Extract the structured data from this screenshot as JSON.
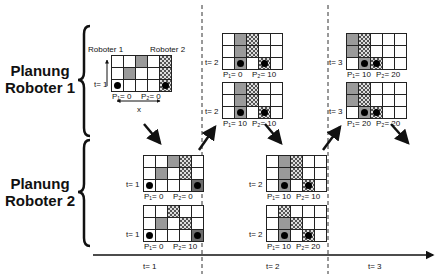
{
  "labels": {
    "planung_r1_line1": "Planung",
    "planung_r1_line2": "Roboter 1",
    "planung_r2_line1": "Planung",
    "planung_r2_line2": "Roboter 2",
    "roboter1": "Roboter 1",
    "roboter2": "Roboter 2",
    "x_axis": "x"
  },
  "timeline": {
    "ticks": [
      "t= 1",
      "t= 2",
      "t= 3"
    ]
  },
  "grids": [
    {
      "id": "init",
      "x": 111,
      "y": 55,
      "t": "t= 1",
      "p1": "P₁= 0",
      "p2": "P₂= 0",
      "cells": [
        [
          "0",
          "0",
          "0",
          "g",
          "0",
          "c"
        ],
        [],
        []
      ]
    },
    {
      "id": "r1-t2-a",
      "x": 222,
      "y": 33,
      "t": "t= 2",
      "p1": "P₁= 0",
      "p2": "P₂= 10"
    },
    {
      "id": "r1-t2-b",
      "x": 222,
      "y": 82,
      "t": "t= 2",
      "p1": "P₁= 10",
      "p2": "P₂= 10"
    },
    {
      "id": "r1-t3-a",
      "x": 346,
      "y": 33,
      "t": "t= 3",
      "p1": "P₁= 10",
      "p2": "P₂= 20"
    },
    {
      "id": "r1-t3-b",
      "x": 346,
      "y": 82,
      "t": "t= 3",
      "p1": "P₁= 20",
      "p2": "P₂= 20"
    },
    {
      "id": "r2-t1-a",
      "x": 143,
      "y": 155,
      "t": "t= 1",
      "p1": "P₁= 0",
      "p2": "P₂= 0"
    },
    {
      "id": "r2-t1-b",
      "x": 143,
      "y": 205,
      "t": "t= 1",
      "p1": "P₁= 0",
      "p2": "P₂= 10"
    },
    {
      "id": "r2-t2-a",
      "x": 266,
      "y": 155,
      "t": "t= 2",
      "p1": "P₁= 10",
      "p2": "P₂= 10"
    },
    {
      "id": "r2-t2-b",
      "x": 266,
      "y": 205,
      "t": "t= 2",
      "p1": "P₁= 10",
      "p2": "P₂= 20"
    }
  ],
  "grid_cells": {
    "init": [
      [
        "0",
        "0",
        "g",
        "0",
        "c"
      ],
      [
        "0",
        "g",
        "0",
        "0",
        "c"
      ],
      [
        "1",
        "0",
        "0",
        "0",
        "2c"
      ]
    ],
    "r1-t2-a": [
      [
        "0",
        "g",
        "c",
        "0",
        "0"
      ],
      [
        "0",
        "g",
        "c",
        "0",
        "0"
      ],
      [
        "0",
        "1g",
        "0",
        "2c",
        "0"
      ]
    ],
    "r1-t2-b": [
      [
        "0",
        "g",
        "c",
        "0",
        "0"
      ],
      [
        "0",
        "g",
        "c",
        "0",
        "0"
      ],
      [
        "0",
        "1g",
        "0",
        "2c",
        "0"
      ]
    ],
    "r1-t3-a": [
      [
        "g",
        "c",
        "0",
        "0",
        "0"
      ],
      [
        "g",
        "c",
        "0",
        "0",
        "0"
      ],
      [
        "0",
        "1g",
        "2c",
        "0",
        "0"
      ]
    ],
    "r1-t3-b": [
      [
        "g",
        "c",
        "0",
        "0",
        "0"
      ],
      [
        "g",
        "c",
        "0",
        "0",
        "0"
      ],
      [
        "0",
        "1g",
        "2c",
        "0",
        "0"
      ]
    ],
    "r2-t1-a": [
      [
        "0",
        "0",
        "g",
        "c",
        "0"
      ],
      [
        "0",
        "g",
        "0",
        "c",
        "0"
      ],
      [
        "1",
        "0",
        "0",
        "0",
        "2d"
      ]
    ],
    "r2-t1-b": [
      [
        "0",
        "0",
        "c",
        "0",
        "0"
      ],
      [
        "0",
        "g",
        "0",
        "c",
        "0"
      ],
      [
        "1",
        "0",
        "0",
        "0",
        "2d"
      ]
    ],
    "r2-t2-a": [
      [
        "0",
        "g",
        "c",
        "0",
        "0"
      ],
      [
        "0",
        "g",
        "c",
        "0",
        "0"
      ],
      [
        "0",
        "1g",
        "0",
        "2c",
        "0"
      ]
    ],
    "r2-t2-b": [
      [
        "0",
        "c",
        "0",
        "0",
        "0"
      ],
      [
        "0",
        "g",
        "c",
        "0",
        "0"
      ],
      [
        "0",
        "1g",
        "0",
        "2c",
        "0"
      ]
    ]
  }
}
